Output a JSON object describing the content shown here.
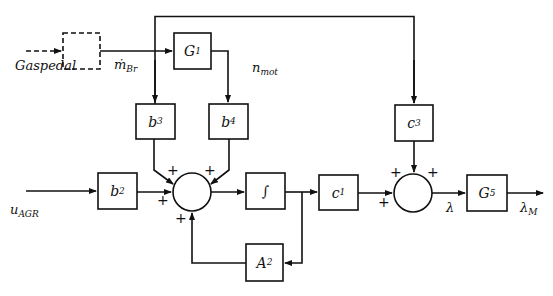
{
  "diagram": {
    "type": "block-diagram",
    "blocks": [
      {
        "id": "sensor",
        "label": "",
        "style": "dashed"
      },
      {
        "id": "G1",
        "base": "G",
        "sub": "1"
      },
      {
        "id": "b3",
        "base": "b",
        "sub": "3"
      },
      {
        "id": "b4",
        "base": "b",
        "sub": "4"
      },
      {
        "id": "b2",
        "base": "b",
        "sub": "2"
      },
      {
        "id": "integrator",
        "base": "∫",
        "sub": ""
      },
      {
        "id": "c1",
        "base": "c",
        "sub": "1"
      },
      {
        "id": "A2",
        "base": "A",
        "sub": "2"
      },
      {
        "id": "c3",
        "base": "c",
        "sub": "3"
      },
      {
        "id": "G5",
        "base": "G",
        "sub": "5"
      }
    ],
    "signals": {
      "gaspedal": "Gaspedal",
      "m_br_base": "ṁ",
      "m_br_sub": "Br",
      "n_mot_base": "n",
      "n_mot_sub": "mot",
      "u_agr_base": "u",
      "u_agr_sub": "AGR",
      "lambda": "λ",
      "lambda_m_base": "λ",
      "lambda_m_sub": "M"
    },
    "summing_junctions": [
      {
        "id": "sum1",
        "signs": [
          "+",
          "+",
          "+",
          "+"
        ]
      },
      {
        "id": "sum2",
        "signs": [
          "+",
          "+",
          "+"
        ]
      }
    ],
    "colors": {
      "line": "#111111",
      "background": "#ffffff"
    }
  }
}
